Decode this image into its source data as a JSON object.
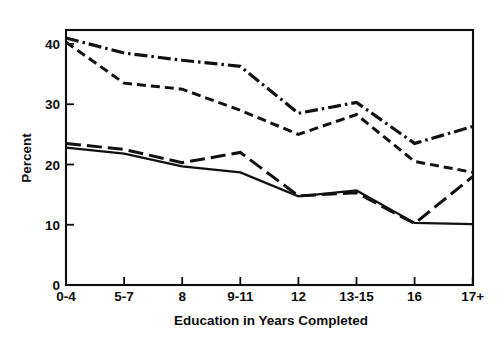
{
  "chart_data": {
    "type": "line",
    "title": "",
    "subtitle": "",
    "xlabel": "Education in Years Completed",
    "ylabel": "Percent",
    "categories": [
      "0-4",
      "5-7",
      "8",
      "9-11",
      "12",
      "13-15",
      "16",
      "17+"
    ],
    "x_tick_labels": [
      "0-4",
      "5-7",
      "8",
      "9-11",
      "12",
      "13-15",
      "16",
      "17+"
    ],
    "y_tick_labels": [
      "0",
      "10",
      "20",
      "30",
      "40"
    ],
    "y_tick_values": [
      0,
      10,
      20,
      30,
      40
    ],
    "ylim": [
      0,
      43.5
    ],
    "xlim_index": [
      0,
      7
    ],
    "grid": false,
    "legend": "none",
    "legend_position": "none",
    "annotations": [],
    "series": [
      {
        "name": "series-dash-dot",
        "style": "dash-dot",
        "color": "#111111",
        "width": 3.2,
        "dasharray": "13,4,2.5,4",
        "values": [
          41.0,
          38.5,
          37.3,
          36.3,
          28.5,
          30.3,
          23.5,
          26.3
        ]
      },
      {
        "name": "series-short-dash",
        "style": "short-dash",
        "color": "#111111",
        "width": 3.0,
        "dasharray": "9,5",
        "values": [
          40.3,
          33.5,
          32.5,
          29.0,
          25.0,
          28.3,
          20.5,
          18.7
        ]
      },
      {
        "name": "series-long-dash",
        "style": "long-dash",
        "color": "#111111",
        "width": 3.0,
        "dasharray": "15,6",
        "values": [
          23.5,
          22.5,
          20.3,
          22.0,
          14.8,
          15.3,
          10.2,
          18.0
        ]
      },
      {
        "name": "series-solid",
        "style": "solid",
        "color": "#111111",
        "width": 2.3,
        "dasharray": "none",
        "values": [
          22.8,
          21.8,
          19.7,
          18.7,
          14.7,
          15.7,
          10.3,
          10.1
        ]
      }
    ]
  },
  "axes": {
    "y_label": "Percent",
    "x_label": "Education in Years Completed",
    "y_ticks": [
      {
        "label": "0",
        "value": 0
      },
      {
        "label": "10",
        "value": 10
      },
      {
        "label": "20",
        "value": 20
      },
      {
        "label": "30",
        "value": 30
      },
      {
        "label": "40",
        "value": 40
      }
    ],
    "x_ticks": [
      {
        "label": "0-4",
        "index": 0
      },
      {
        "label": "5-7",
        "index": 1
      },
      {
        "label": "8",
        "index": 2
      },
      {
        "label": "9-11",
        "index": 3
      },
      {
        "label": "12",
        "index": 4
      },
      {
        "label": "13-15",
        "index": 5
      },
      {
        "label": "16",
        "index": 6
      },
      {
        "label": "17+",
        "index": 7
      }
    ]
  },
  "colors": {
    "background": "#ffffff",
    "ink": "#111111",
    "axis": "#0d0d0d"
  }
}
